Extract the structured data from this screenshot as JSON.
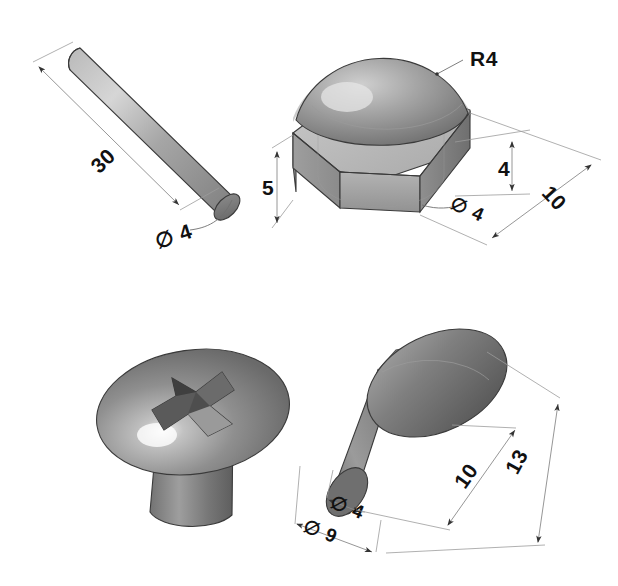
{
  "sheet": {
    "background_color": "#ffffff",
    "ink_color": "#111111",
    "dimension_line_color": "#8a8a8a",
    "part_fill_light": "#d8d8d8",
    "part_fill_mid": "#a9a9a9",
    "part_fill_dark": "#6e6e6e"
  },
  "figures": [
    {
      "id": "fig-pin",
      "name": "cylindrical-pin",
      "title": "",
      "dimensions": [
        {
          "key": "length",
          "label": "30",
          "symbol": "",
          "rotation": -60
        },
        {
          "key": "diameter",
          "label": "4",
          "symbol": "∅",
          "rotation": -30
        }
      ]
    },
    {
      "id": "fig-dome-nut",
      "name": "hex-dome-nut",
      "title": "",
      "dimensions": [
        {
          "key": "dome_radius",
          "label": "R4",
          "symbol": "",
          "rotation": 0
        },
        {
          "key": "body_height",
          "label": "5",
          "symbol": "",
          "rotation": 0
        },
        {
          "key": "bore_depth",
          "label": "4",
          "symbol": "",
          "rotation": 0
        },
        {
          "key": "bore_diameter",
          "label": "4",
          "symbol": "∅",
          "rotation": 30
        },
        {
          "key": "across_flats",
          "label": "10",
          "symbol": "",
          "rotation": 60
        }
      ]
    },
    {
      "id": "fig-phillips-screw",
      "name": "phillips-round-head-screw",
      "title": "",
      "dimensions": []
    },
    {
      "id": "fig-rivet",
      "name": "round-head-rivet",
      "title": "",
      "dimensions": [
        {
          "key": "shank_diameter",
          "label": "4",
          "symbol": "∅",
          "rotation": 30
        },
        {
          "key": "head_diameter",
          "label": "9",
          "symbol": "∅",
          "rotation": 30
        },
        {
          "key": "shank_length",
          "label": "10",
          "symbol": "",
          "rotation": -60
        },
        {
          "key": "overall_length",
          "label": "13",
          "symbol": "",
          "rotation": -60
        }
      ]
    }
  ],
  "labels": {
    "pin_length": "30",
    "pin_diameter": "∅ 4",
    "nut_radius": "R4",
    "nut_height": "5",
    "nut_bore_depth": "4",
    "nut_bore_diameter": "∅ 4",
    "nut_across_flats": "10",
    "rivet_shank_diameter": "∅ 4",
    "rivet_head_diameter": "∅ 9",
    "rivet_shank_length": "10",
    "rivet_overall_length": "13"
  }
}
